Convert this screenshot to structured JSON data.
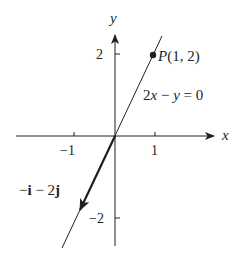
{
  "figure": {
    "axes": {
      "x_label": "x",
      "y_label": "y",
      "x_ticks": [
        {
          "value": -1,
          "label": "−1"
        },
        {
          "value": 1,
          "label": "1"
        }
      ],
      "y_ticks": [
        {
          "value": 2,
          "label": "2"
        },
        {
          "value": -2,
          "label": "−2"
        }
      ]
    },
    "line": {
      "equation_label_lhs": "2",
      "equation_label_var1": "x",
      "equation_label_mid": " − ",
      "equation_label_var2": "y",
      "equation_label_rhs": " = 0"
    },
    "point": {
      "name": "P",
      "coords_label": "(1, 2)"
    },
    "vector": {
      "label_minus": "−",
      "label_i": "i",
      "label_mid": " − 2",
      "label_j": "j"
    },
    "colors": {
      "ink": "#231f20",
      "background": "#ffffff"
    }
  }
}
